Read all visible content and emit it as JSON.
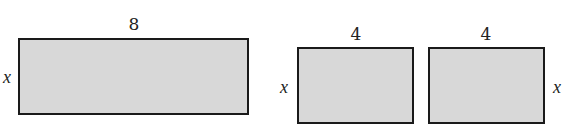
{
  "diagram": {
    "shapes": [
      {
        "id": "rect-large",
        "width_label": "8",
        "height_label": "x"
      },
      {
        "id": "rect-left-half",
        "width_label": "4",
        "height_label": "x"
      },
      {
        "id": "rect-right-half",
        "width_label": "4",
        "height_label": "x"
      }
    ]
  }
}
